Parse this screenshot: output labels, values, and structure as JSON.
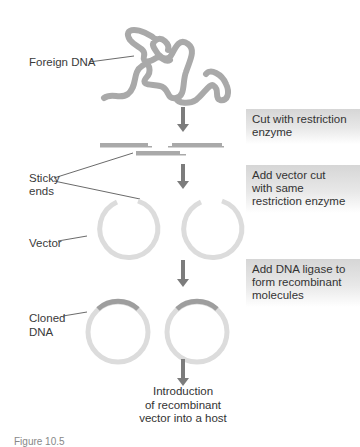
{
  "figure": {
    "labels": {
      "foreign_dna": "Foreign DNA",
      "sticky_ends_line1": "Sticky",
      "sticky_ends_line2": "ends",
      "vector": "Vector",
      "cloned_dna_line1": "Cloned",
      "cloned_dna_line2": "DNA"
    },
    "steps": [
      {
        "line1": "Cut with restriction",
        "line2": "enzyme",
        "line3": ""
      },
      {
        "line1": "Add vector cut",
        "line2": "with same",
        "line3": "restriction enzyme"
      },
      {
        "line1": "Add DNA ligase to",
        "line2": "form recombinant",
        "line3": "molecules"
      }
    ],
    "result": {
      "line1": "Introduction",
      "line2": "of recombinant",
      "line3": "vector into a host"
    },
    "caption_fragment": "Figure 10.5"
  },
  "colors": {
    "dna_strand": "#a9a9a9",
    "vector_ring": "#dcdcdc",
    "insert_segment": "#9e9e9e",
    "arrow": "#7c7c7c",
    "step_box_top": "#d6d6d6"
  }
}
